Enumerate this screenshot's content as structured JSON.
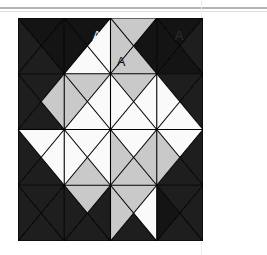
{
  "figure": {
    "geometry": {
      "x": 18,
      "y": 18,
      "width": 185,
      "height": 223,
      "rows": 4,
      "cols": 4,
      "cell_w": 46.25,
      "cell_h": 55.75,
      "stroke": "#000000",
      "stroke_width": 1.1
    },
    "palette": {
      "black": "#141414",
      "dark": "#1e1e1e",
      "white": "#fafafa",
      "gray": "#c9c9c9",
      "outline": "#000000",
      "rule": "#b4b4b4",
      "faint_rule": "#e2e2e2",
      "background": "#ffffff"
    },
    "cells": [
      {
        "row": 0,
        "col": 0,
        "top": "black",
        "right": "black",
        "bottom": "dark",
        "left": "dark"
      },
      {
        "row": 0,
        "col": 1,
        "top": "black",
        "right": "white",
        "bottom": "white",
        "left": "black"
      },
      {
        "row": 0,
        "col": 2,
        "top": "gray",
        "right": "black",
        "bottom": "gray",
        "left": "gray"
      },
      {
        "row": 0,
        "col": 3,
        "top": "black",
        "right": "dark",
        "bottom": "black",
        "left": "black"
      },
      {
        "row": 1,
        "col": 0,
        "top": "dark",
        "right": "gray",
        "bottom": "dark",
        "left": "dark"
      },
      {
        "row": 1,
        "col": 1,
        "top": "gray",
        "right": "white",
        "bottom": "white",
        "left": "gray"
      },
      {
        "row": 1,
        "col": 2,
        "top": "gray",
        "right": "white",
        "bottom": "white",
        "left": "white"
      },
      {
        "row": 1,
        "col": 3,
        "top": "dark",
        "right": "dark",
        "bottom": "white",
        "left": "white"
      },
      {
        "row": 2,
        "col": 0,
        "top": "white",
        "right": "white",
        "bottom": "dark",
        "left": "dark"
      },
      {
        "row": 2,
        "col": 1,
        "top": "white",
        "right": "white",
        "bottom": "gray",
        "left": "white"
      },
      {
        "row": 2,
        "col": 2,
        "top": "white",
        "right": "gray",
        "bottom": "gray",
        "left": "gray"
      },
      {
        "row": 2,
        "col": 3,
        "top": "white",
        "right": "dark",
        "bottom": "dark",
        "left": "gray"
      },
      {
        "row": 3,
        "col": 0,
        "top": "dark",
        "right": "dark",
        "bottom": "dark",
        "left": "dark"
      },
      {
        "row": 3,
        "col": 1,
        "top": "gray",
        "right": "dark",
        "bottom": "dark",
        "left": "dark"
      },
      {
        "row": 3,
        "col": 2,
        "top": "gray",
        "right": "white",
        "bottom": "dark",
        "left": "gray"
      },
      {
        "row": 3,
        "col": 3,
        "top": "dark",
        "right": "dark",
        "bottom": "dark",
        "left": "black"
      }
    ],
    "labels": [
      {
        "text": "A",
        "x": 97,
        "y": 37,
        "color": "#ffffff"
      },
      {
        "text": "A",
        "x": 121,
        "y": 63,
        "color": "#111111"
      },
      {
        "text": "A",
        "x": 155,
        "y": 63,
        "color": "#111111"
      },
      {
        "text": "A",
        "x": 179,
        "y": 37,
        "color": "#2f2f2f"
      }
    ]
  },
  "rules": {
    "top_rule": {
      "y": 7,
      "height": 2,
      "color": "#b4b4b4"
    },
    "top_hairline": {
      "y": 11,
      "height": 1,
      "color": "#dddddd"
    },
    "right_rule": {
      "x": 201,
      "height": 255,
      "color": "#ececec"
    }
  }
}
